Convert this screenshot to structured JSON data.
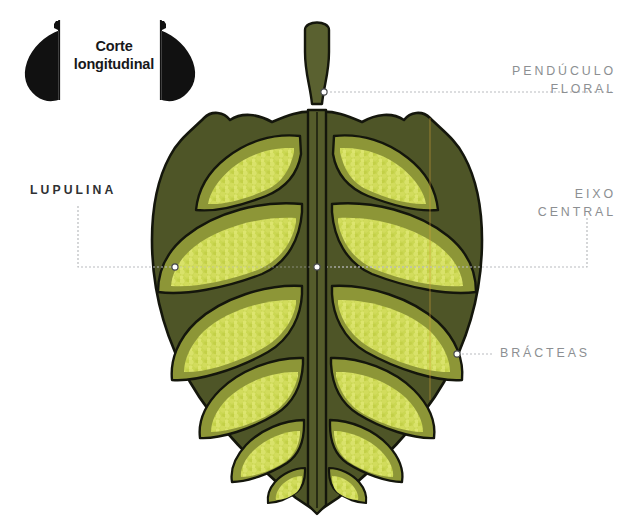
{
  "figure": {
    "background_color": "#ffffff"
  },
  "badge": {
    "name": "corte-longitudinal-badge",
    "line1": "Corte",
    "line2": "longitudinal",
    "text_color": "#17181a",
    "silhouette_color": "#111111",
    "cut_line_color": "#111111"
  },
  "callouts": [
    {
      "id": "penduculo-floral",
      "line1": "PENDÚCULO",
      "line2": "FLORAL",
      "style": "light",
      "color": "#8c8f92",
      "align": "right"
    },
    {
      "id": "eixo-central",
      "line1": "EIXO",
      "line2": "CENTRAL",
      "style": "light",
      "color": "#8c8f92",
      "align": "right"
    },
    {
      "id": "bracteas",
      "line1": "BRÁCTEAS",
      "line2": "",
      "style": "light",
      "color": "#8c8f92",
      "align": "left"
    },
    {
      "id": "lupulina",
      "line1": "LUPULINA",
      "line2": "",
      "style": "dark",
      "color": "#2f3133",
      "align": "left"
    }
  ],
  "leader_lines": {
    "color": "#b9bcbf",
    "marker_stroke": "#4a4c4e",
    "marker_fill": "#ffffff"
  },
  "palette": {
    "bract_dark": "#4e5527",
    "bract_outline": "#14160c",
    "chamber_mid": "#8d9637",
    "lupulin_light": "#c9d650",
    "lupulin_gland": "#d7e061",
    "axis_strip": "#555c2b",
    "peduncle": "#5a6130",
    "guide_orange": "#d8a23a"
  },
  "structure": {
    "bract_pairs": 6,
    "has_central_axis": true,
    "has_peduncle": true,
    "symmetry": "bilateral"
  }
}
